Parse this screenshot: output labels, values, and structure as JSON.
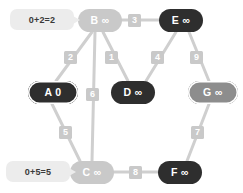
{
  "diagram": {
    "background": "#ffffff",
    "colors": {
      "edge": "#cfcfcf",
      "edge_dim": "#dcdcdc",
      "node_light": "#c9c9c9",
      "node_mid": "#8d8d8d",
      "node_dark": "#2e2e2e",
      "weight_chip": "#c9c9c9",
      "callout_bg": "#ececec",
      "text_on_dark": "#ffffff",
      "callout_text": "#3a3a3a"
    }
  },
  "nodes": [
    {
      "id": "A",
      "label": "A 0",
      "name": "a",
      "dist": "0",
      "style": "dark-ring",
      "x": 28,
      "y": 81,
      "w": 50,
      "h": 23
    },
    {
      "id": "B",
      "label": "B ∞",
      "name": "b",
      "dist": "∞",
      "style": "light",
      "x": 78,
      "y": 9,
      "w": 44,
      "h": 23
    },
    {
      "id": "C",
      "label": "C ∞",
      "name": "c",
      "dist": "∞",
      "style": "light",
      "x": 70,
      "y": 161,
      "w": 44,
      "h": 23
    },
    {
      "id": "D",
      "label": "D ∞",
      "name": "d",
      "dist": "∞",
      "style": "dark",
      "x": 111,
      "y": 81,
      "w": 44,
      "h": 23
    },
    {
      "id": "E",
      "label": "E ∞",
      "name": "e",
      "dist": "∞",
      "style": "dark",
      "x": 159,
      "y": 9,
      "w": 44,
      "h": 23
    },
    {
      "id": "F",
      "label": "F ∞",
      "name": "f",
      "dist": "∞",
      "style": "dark",
      "x": 158,
      "y": 161,
      "w": 44,
      "h": 23
    },
    {
      "id": "G",
      "label": "G ∞",
      "name": "g",
      "dist": "∞",
      "style": "mid-ring",
      "x": 188,
      "y": 81,
      "w": 50,
      "h": 23
    }
  ],
  "edges": [
    {
      "from": "B",
      "to": "A",
      "weight": "2",
      "name": "edge-b-a",
      "x1": 92,
      "y1": 32,
      "x2": 56,
      "y2": 81,
      "wx": 64,
      "wy": 51
    },
    {
      "from": "B",
      "to": "E",
      "weight": "3",
      "name": "edge-b-e",
      "x1": 122,
      "y1": 20,
      "x2": 159,
      "y2": 20,
      "wx": 128,
      "wy": 14
    },
    {
      "from": "B",
      "to": "D",
      "weight": "1",
      "name": "edge-b-d",
      "x1": 103,
      "y1": 32,
      "x2": 128,
      "y2": 81,
      "wx": 105,
      "wy": 51
    },
    {
      "from": "B",
      "to": "C",
      "weight": "6",
      "name": "edge-b-c",
      "x1": 95,
      "y1": 32,
      "x2": 92,
      "y2": 161,
      "wx": 86,
      "wy": 88
    },
    {
      "from": "A",
      "to": "C",
      "weight": "5",
      "name": "edge-a-c",
      "x1": 52,
      "y1": 104,
      "x2": 80,
      "y2": 161,
      "wx": 59,
      "wy": 126
    },
    {
      "from": "E",
      "to": "D",
      "weight": "4",
      "name": "edge-e-d",
      "x1": 176,
      "y1": 32,
      "x2": 146,
      "y2": 81,
      "wx": 151,
      "wy": 51
    },
    {
      "from": "E",
      "to": "G",
      "weight": "9",
      "name": "edge-e-g",
      "x1": 189,
      "y1": 32,
      "x2": 209,
      "y2": 81,
      "wx": 190,
      "wy": 51
    },
    {
      "from": "G",
      "to": "F",
      "weight": "7",
      "name": "edge-g-f",
      "x1": 209,
      "y1": 104,
      "x2": 187,
      "y2": 161,
      "wx": 191,
      "wy": 126
    },
    {
      "from": "C",
      "to": "F",
      "weight": "8",
      "name": "edge-c-f",
      "x1": 114,
      "y1": 172,
      "x2": 158,
      "y2": 172,
      "wx": 129,
      "wy": 166
    }
  ],
  "callouts": [
    {
      "id": "callout-b",
      "text": "0+2=2",
      "name": "callout-b-distance",
      "x": 10,
      "y": 9,
      "w": 64,
      "h": 21
    },
    {
      "id": "callout-c",
      "text": "0+5=5",
      "name": "callout-c-distance",
      "x": 6,
      "y": 161,
      "w": 64,
      "h": 21
    }
  ]
}
